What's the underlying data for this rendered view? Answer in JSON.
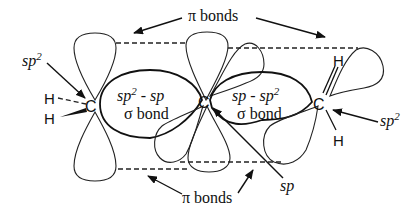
{
  "diagram": {
    "labels": {
      "pi_bonds_top": "π bonds",
      "pi_bonds_bottom": "π bonds",
      "sigma_left_line1_a": "sp",
      "sigma_left_line1_sup": "2",
      "sigma_left_line1_b": " - sp",
      "sigma_left_line2": "σ bond",
      "sigma_right_line1_a": "sp - sp",
      "sigma_right_line1_sup": "2",
      "sigma_right_line2": "σ bond",
      "hyb_left": "sp",
      "hyb_left_sup": "2",
      "hyb_right": "sp",
      "hyb_right_sup": "2",
      "hyb_center": "sp"
    },
    "atoms": {
      "c_left": "C",
      "c_center": "C",
      "c_right": "C",
      "h_left_top": "H",
      "h_left_bottom": "H",
      "h_right_top": "H",
      "h_right_bottom": "H"
    }
  }
}
